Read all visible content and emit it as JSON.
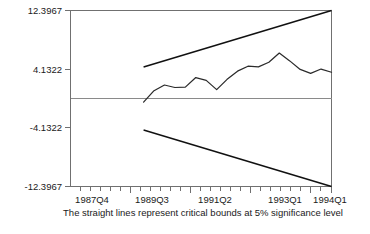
{
  "chart_data": {
    "type": "line",
    "title": "",
    "subtitle": "",
    "caption": "The straight lines represent critical bounds at 5% significance level",
    "xlabel": "",
    "ylabel": "",
    "grid": false,
    "legend_position": "none",
    "ylim": [
      -12.3967,
      12.3967
    ],
    "ytick_labels": [
      "12.3967",
      "4.1322",
      "-4.1322",
      "-12.3967"
    ],
    "ytick_values": [
      12.3967,
      4.1322,
      -4.1322,
      -12.3967
    ],
    "xtick_labels": [
      "1987Q4",
      "1989Q3",
      "1991Q2",
      "1993Q1",
      "1994Q1"
    ],
    "xtick_values": [
      "1987Q4",
      "1989Q3",
      "1991Q2",
      "1993Q1",
      "1994Q1"
    ],
    "x_quarters": [
      "1987Q4",
      "1988Q1",
      "1988Q2",
      "1988Q3",
      "1988Q4",
      "1989Q1",
      "1989Q2",
      "1989Q3",
      "1989Q4",
      "1990Q1",
      "1990Q2",
      "1990Q3",
      "1990Q4",
      "1991Q1",
      "1991Q2",
      "1991Q3",
      "1991Q4",
      "1992Q1",
      "1992Q2",
      "1992Q3",
      "1992Q4",
      "1993Q1",
      "1993Q2",
      "1993Q3",
      "1993Q4",
      "1994Q1"
    ],
    "series": [
      {
        "name": "CUSUM",
        "kind": "statistic",
        "x": [
          "1989Q3",
          "1989Q4",
          "1990Q1",
          "1990Q2",
          "1990Q3",
          "1990Q4",
          "1991Q1",
          "1991Q2",
          "1991Q3",
          "1991Q4",
          "1992Q1",
          "1992Q2",
          "1992Q3",
          "1992Q4",
          "1993Q1",
          "1993Q2",
          "1993Q3",
          "1993Q4",
          "1994Q1"
        ],
        "values": [
          -0.5,
          1.1,
          1.9,
          1.55,
          1.6,
          2.95,
          2.55,
          1.25,
          2.7,
          3.85,
          4.55,
          4.45,
          5.1,
          6.4,
          5.3,
          4.1,
          3.55,
          4.15,
          3.7
        ]
      },
      {
        "name": "Upper 5% critical bound",
        "kind": "bound",
        "x": [
          "1989Q3",
          "1994Q1"
        ],
        "values": [
          4.45,
          12.3967
        ]
      },
      {
        "name": "Lower 5% critical bound",
        "kind": "bound",
        "x": [
          "1989Q3",
          "1994Q1"
        ],
        "values": [
          -4.45,
          -12.3967
        ]
      }
    ],
    "zero_line": 0,
    "minor_tick_count": 26
  }
}
